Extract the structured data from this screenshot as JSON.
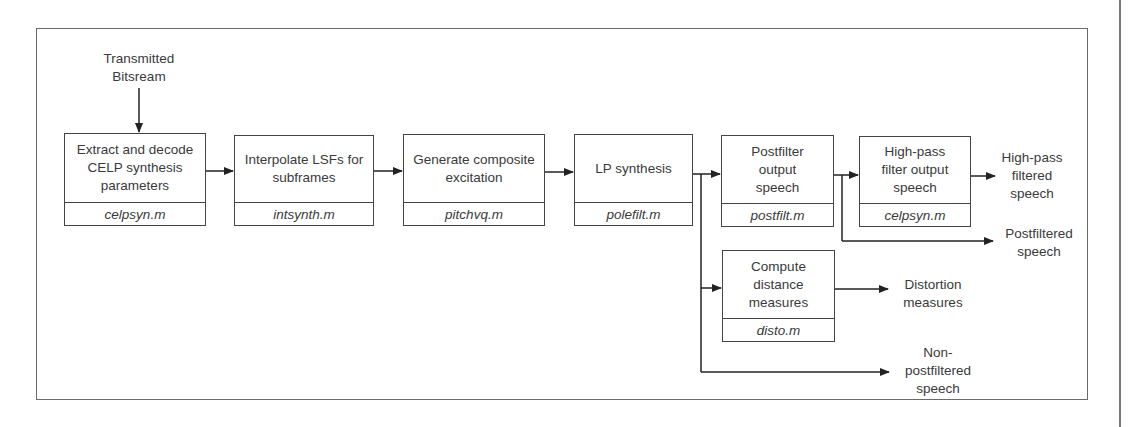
{
  "diagram": {
    "input": {
      "label": "Transmitted\nBitsream"
    },
    "blocks": [
      {
        "id": "extract",
        "title": "Extract and decode\nCELP synthesis\nparameters",
        "file": "celpsyn.m"
      },
      {
        "id": "interpolate",
        "title": "Interpolate LSFs for\nsubframes",
        "file": "intsynth.m"
      },
      {
        "id": "excitation",
        "title": "Generate composite\nexcitation",
        "file": "pitchvq.m"
      },
      {
        "id": "lpsynth",
        "title": "LP synthesis",
        "file": "polefilt.m"
      },
      {
        "id": "postfilter",
        "title": "Postfilter\noutput\nspeech",
        "file": "postfilt.m"
      },
      {
        "id": "highpass",
        "title": "High-pass\nfilter output\nspeech",
        "file": "celpsyn.m"
      },
      {
        "id": "distance",
        "title": "Compute\ndistance\nmeasures",
        "file": "disto.m"
      }
    ],
    "outputs": [
      {
        "id": "hp_out",
        "label": "High-pass\nfiltered\nspeech"
      },
      {
        "id": "pf_out",
        "label": "Postfiltered\nspeech"
      },
      {
        "id": "dist_out",
        "label": "Distortion\nmeasures"
      },
      {
        "id": "npf_out",
        "label": "Non-\npostfiltered\nspeech"
      }
    ],
    "colors": {
      "line": "#222222",
      "frame": "#6a6a6a",
      "text": "#3a3a3a"
    }
  }
}
